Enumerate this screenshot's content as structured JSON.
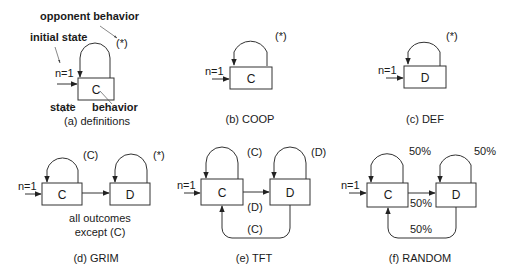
{
  "panels": [
    {
      "id": "a",
      "caption": "(a) definitions",
      "initial_label": "n=1",
      "states": [
        {
          "label": "C"
        }
      ],
      "self_loop_labels": [
        "(*)"
      ],
      "annotations": {
        "opponent_behavior": "opponent behavior",
        "initial_state": "initial state",
        "state": "state",
        "behavior": "behavior"
      }
    },
    {
      "id": "b",
      "caption": "(b) COOP",
      "initial_label": "n=1",
      "states": [
        {
          "label": "C"
        }
      ],
      "self_loop_labels": [
        "(*)"
      ]
    },
    {
      "id": "c",
      "caption": "(c) DEF",
      "initial_label": "n=1",
      "states": [
        {
          "label": "D"
        }
      ],
      "self_loop_labels": [
        "(*)"
      ]
    },
    {
      "id": "d",
      "caption": "(d) GRIM",
      "initial_label": "n=1",
      "states": [
        {
          "label": "C"
        },
        {
          "label": "D"
        }
      ],
      "self_loop_labels": [
        "(C)",
        "(*)"
      ],
      "transition_label_line1": "all outcomes",
      "transition_label_line2": "except (C)"
    },
    {
      "id": "e",
      "caption": "(e) TFT",
      "initial_label": "n=1",
      "states": [
        {
          "label": "C"
        },
        {
          "label": "D"
        }
      ],
      "self_loop_labels": [
        "(C)",
        "(D)"
      ],
      "forward_label": "(D)",
      "back_label": "(C)"
    },
    {
      "id": "f",
      "caption": "(f) RANDOM",
      "initial_label": "n=1",
      "states": [
        {
          "label": "C"
        },
        {
          "label": "D"
        }
      ],
      "self_loop_labels": [
        "50%",
        "50%"
      ],
      "forward_label": "50%",
      "back_label": "50%"
    }
  ]
}
